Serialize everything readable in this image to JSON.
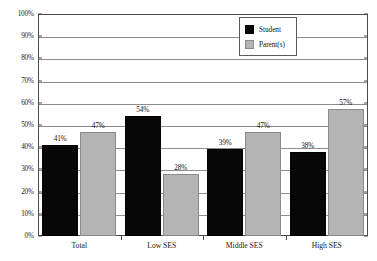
{
  "chart_data": {
    "type": "bar",
    "title": "",
    "subtitle": "",
    "xlabel": "",
    "ylabel": "",
    "categories": [
      "Total",
      "Low SES",
      "Middle SES",
      "High SES"
    ],
    "series": [
      {
        "name": "Student",
        "color": "#070707",
        "values": [
          41,
          54,
          39,
          38
        ],
        "value_labels": [
          "41%",
          "54%",
          "39%",
          "38%"
        ]
      },
      {
        "name": "Parent(s)",
        "color": "#b4b4b4",
        "values": [
          47,
          28,
          47,
          57
        ],
        "value_labels": [
          "47%",
          "28%",
          "47%",
          "57%"
        ]
      }
    ],
    "ylim": [
      0,
      100
    ],
    "y_ticks": [
      0,
      10,
      20,
      30,
      40,
      50,
      60,
      70,
      80,
      90,
      100
    ],
    "y_tick_labels": [
      "0%",
      "10%",
      "20%",
      "30%",
      "40%",
      "50%",
      "60%",
      "70%",
      "80%",
      "90%",
      "100%"
    ],
    "grid": "horizontal",
    "legend_position": "top-right",
    "legend_entries": [
      "Student",
      "Parent(s)"
    ]
  }
}
